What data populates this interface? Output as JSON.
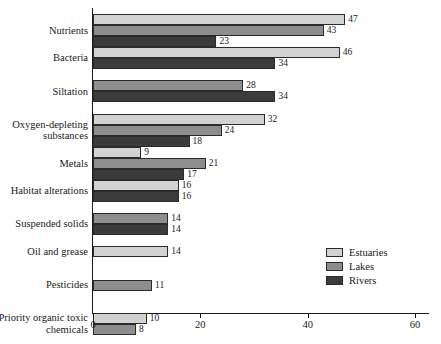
{
  "chart_data": {
    "type": "bar",
    "orientation": "horizontal",
    "title": "",
    "xlabel": "",
    "ylabel": "",
    "xlim": [
      0,
      60
    ],
    "xticks": [
      0,
      20,
      40,
      60
    ],
    "xtick_labels": [
      "0",
      "20",
      "40",
      "60"
    ],
    "grid": false,
    "legend_position": "right",
    "categories": [
      "Nutrients",
      "Bacteria",
      "Siltation",
      "Oxygen-depleting\nsubstances",
      "Metals",
      "Habitat alterations",
      "Suspended solids",
      "Oil and grease",
      "Pesticides",
      "Priority organic toxic\nchemicals"
    ],
    "series": [
      {
        "name": "Estuaries",
        "color": "#d2d2d2",
        "values": [
          47,
          46,
          null,
          32,
          9,
          16,
          null,
          14,
          null,
          10
        ]
      },
      {
        "name": "Lakes",
        "color": "#8d8d8d",
        "values": [
          43,
          null,
          28,
          24,
          21,
          null,
          14,
          null,
          11,
          8
        ]
      },
      {
        "name": "Rivers",
        "color": "#3b3b3b",
        "values": [
          23,
          34,
          34,
          18,
          17,
          16,
          14,
          null,
          null,
          null
        ]
      }
    ]
  },
  "legend": {
    "items": [
      {
        "label": "Estuaries",
        "color": "#d2d2d2"
      },
      {
        "label": "Lakes",
        "color": "#8d8d8d"
      },
      {
        "label": "Rivers",
        "color": "#3b3b3b"
      }
    ]
  },
  "axis": {
    "x_tick_labels": [
      "0",
      "20",
      "40",
      "60"
    ]
  }
}
